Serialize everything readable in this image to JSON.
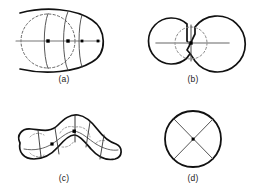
{
  "figure": {
    "background_color": "#ffffff",
    "outline_color": "#111111",
    "dashed_color": "#666666",
    "axis_color": "#777777",
    "node_color": "#000000",
    "label_color": "#222222",
    "panel_count": 4,
    "grid": "2x2"
  },
  "panels": [
    {
      "id": "a",
      "label": "(a)",
      "shape_name": "ovoid-open-left",
      "description": "Egg shaped outline open at left with inscribed dashed circle, horizontal medial axis and curved cross-section arcs",
      "features": {
        "outline": "ovoid",
        "inscribed_circle": "dashed",
        "axis": "horizontal",
        "cross_sections": 3,
        "nodes": 4
      }
    },
    {
      "id": "b",
      "label": "(b)",
      "shape_name": "two-joined-circles",
      "description": "Peanut / dumbbell formed by two circles meeting at a narrow waist with dashed circle at the neck",
      "features": {
        "outline": "bi-circular",
        "inscribed_circle": "dashed",
        "axis": "horizontal",
        "cross_sections": 1,
        "nodes": 1
      }
    },
    {
      "id": "c",
      "label": "(c)",
      "shape_name": "boomerang",
      "description": "Bent elongated blob with dashed inscribed arcs, branching medial axis and solid cross-section segments",
      "features": {
        "outline": "chevron-blob",
        "inscribed_circle": "dashed",
        "axis": "branched",
        "cross_sections": 6,
        "nodes": 2
      }
    },
    {
      "id": "d",
      "label": "(d)",
      "shape_name": "circle-with-cross",
      "description": "Plain circle containing two crossing chords forming an X with a single central node",
      "features": {
        "outline": "circle",
        "inscribed_circle": "none",
        "axis": "crossed-chords",
        "cross_sections": 2,
        "nodes": 1
      }
    }
  ]
}
